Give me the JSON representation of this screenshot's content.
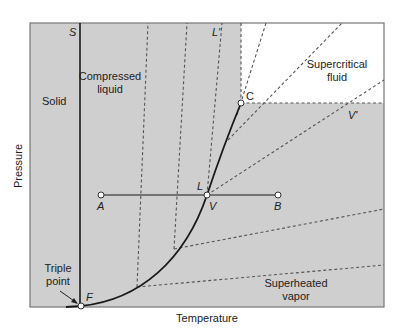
{
  "axes": {
    "xlabel": "Temperature",
    "ylabel": "Pressure"
  },
  "regions": {
    "solid": "Solid",
    "compressed_liquid_line1": "Compressed",
    "compressed_liquid_line2": "liquid",
    "supercritical_line1": "Supercritical",
    "supercritical_line2": "fluid",
    "superheated_line1": "Superheated",
    "superheated_line2": "vapor"
  },
  "points": {
    "S": "S",
    "L_prime": "L'",
    "C": "C",
    "V_prime": "V'",
    "A": "A",
    "L": "L",
    "V": "V",
    "B": "B",
    "F": "F",
    "triple_line1": "Triple",
    "triple_line2": "point"
  },
  "colors": {
    "region_fill": "#cfcfcf",
    "supercritical_fill": "#ffffff",
    "line": "#1a1a1a",
    "dashed": "#555555"
  }
}
